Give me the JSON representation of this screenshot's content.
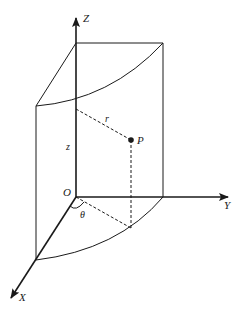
{
  "diagram": {
    "colors": {
      "ink": "#1a1a1a",
      "background": "#ffffff"
    },
    "axes": {
      "z": {
        "label": "Z"
      },
      "y": {
        "label": "Y"
      },
      "x": {
        "label": "X"
      },
      "origin": {
        "label": "O"
      }
    },
    "point": {
      "label": "P"
    },
    "radius": {
      "label": "r"
    },
    "height": {
      "label": "z"
    },
    "angle": {
      "label": "θ"
    }
  }
}
